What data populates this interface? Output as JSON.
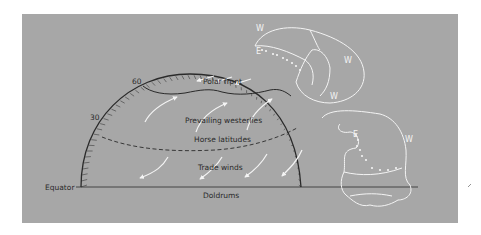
{
  "diagram": {
    "colors": {
      "panel": "#a7a7a7",
      "outline": "#2a2a2a",
      "arrows": "#f4f4f4",
      "background": "#ffffff"
    },
    "latitude_labels": {
      "lat60": "60",
      "lat30": "30",
      "equator": "Equator"
    },
    "zones": {
      "polar_front": "Polar front",
      "prevailing_westerlies": "Prevailing westerlies",
      "horse_latitudes": "Horse latitudes",
      "trade_winds": "Trade winds",
      "doldrums": "Doldrums"
    },
    "cell_labels": {
      "upper_w1": "W",
      "upper_e": "E",
      "upper_w2": "W",
      "upper_w3": "W",
      "lower_e": "E",
      "lower_w": "W"
    }
  }
}
